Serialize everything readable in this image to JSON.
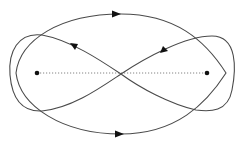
{
  "diagram": {
    "type": "orbit-diagram",
    "colors": {
      "stroke": "#4a4a4a",
      "points": "#111111",
      "background": "#ffffff"
    },
    "points": [
      {
        "name": "left-mass",
        "x": 37,
        "y": 73
      },
      {
        "name": "right-mass",
        "x": 207,
        "y": 73
      }
    ],
    "curves": [
      {
        "name": "outer-ellipse",
        "direction": "clockwise",
        "arrows": [
          "top pointing right",
          "bottom pointing right"
        ]
      },
      {
        "name": "figure-eight",
        "direction": "figure-eight",
        "arrows": [
          "upper-left pointing up-left",
          "upper-right pointing down-left"
        ]
      }
    ],
    "labels": []
  }
}
